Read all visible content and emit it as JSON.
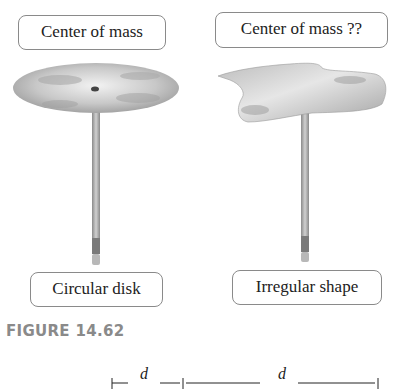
{
  "figure": {
    "caption": "FIGURE 14.62",
    "left_panel": {
      "top_label": "Center of mass",
      "bottom_label": "Circular disk",
      "shape": "circular-disk balanced on pencil"
    },
    "right_panel": {
      "top_label": "Center of mass ??",
      "bottom_label": "Irregular shape",
      "shape": "irregular-plate balanced on pencil"
    }
  },
  "next_figure_fragment": {
    "labels": [
      "d",
      "d"
    ]
  }
}
